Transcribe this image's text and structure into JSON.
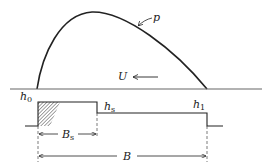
{
  "diagram": {
    "type": "slider bearing pressure profile",
    "labels": {
      "pressure": "p",
      "velocity": "U",
      "h0": "h",
      "h0_sub": "0",
      "hs": "h",
      "hs_sub": "s",
      "h1": "h",
      "h1_sub": "1",
      "Bs": "B",
      "Bs_sub": "s",
      "B": "B"
    },
    "colors": {
      "line": "#222222",
      "hatch": "#555555",
      "background": "#ffffff"
    }
  }
}
